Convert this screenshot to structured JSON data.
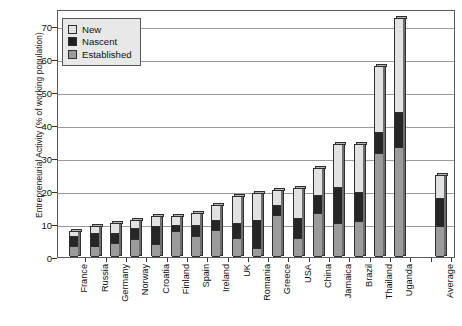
{
  "chart_data": {
    "type": "bar",
    "subtype": "stacked-bar",
    "title": "",
    "xlabel": "",
    "ylabel": "Entrepreneurial Activity (% of working population)",
    "ylim": [
      0,
      75
    ],
    "yticks": [
      0,
      10,
      20,
      30,
      40,
      50,
      60,
      70
    ],
    "ytick_labels": [
      "0",
      "10",
      "20",
      "30",
      "40",
      "50",
      "60",
      "70"
    ],
    "grid": true,
    "grid_axis": "y",
    "legend_position": "upper-left-inside",
    "stack_order_bottom_to_top": [
      "Established",
      "Nascent",
      "New"
    ],
    "categories": [
      "France",
      "Russia",
      "Germany",
      "Norway",
      "Croatia",
      "Finland",
      "Spain",
      "Ireland",
      "UK",
      "Romania",
      "Greece",
      "USA",
      "China",
      "Jamaica",
      "Brazil",
      "Thailand",
      "Uganda",
      "",
      "Average"
    ],
    "series": [
      {
        "name": "Established",
        "color": "#9b9b9b",
        "values": [
          3.0,
          3.0,
          4.0,
          5.0,
          3.5,
          7.5,
          6.0,
          8.0,
          5.5,
          2.5,
          12.5,
          5.5,
          13.0,
          10.0,
          10.5,
          31.0,
          33.0,
          null,
          9.0
        ]
      },
      {
        "name": "Nascent",
        "color": "#262626",
        "values": [
          3.0,
          4.0,
          3.0,
          3.5,
          5.5,
          2.0,
          3.5,
          3.0,
          4.5,
          8.5,
          3.0,
          6.0,
          5.5,
          11.0,
          9.0,
          6.5,
          10.5,
          null,
          8.5
        ]
      },
      {
        "name": "New",
        "color": "#e2e2e2",
        "values": [
          1.5,
          2.0,
          3.0,
          2.5,
          3.0,
          2.5,
          3.5,
          4.5,
          8.0,
          8.0,
          4.5,
          9.0,
          8.0,
          13.0,
          14.5,
          20.0,
          28.5,
          null,
          7.0
        ]
      }
    ],
    "totals": [
      7.5,
      9.0,
      10.0,
      11.0,
      12.0,
      12.0,
      13.0,
      15.5,
      18.0,
      19.0,
      20.0,
      20.5,
      26.5,
      34.0,
      34.0,
      57.5,
      72.0,
      null,
      24.5
    ]
  },
  "legend": {
    "items": [
      {
        "label": "New",
        "swatch": "new"
      },
      {
        "label": "Nascent",
        "swatch": "nascent"
      },
      {
        "label": "Established",
        "swatch": "established"
      }
    ]
  },
  "colors": {
    "new": "#e2e2e2",
    "nascent": "#262626",
    "established": "#9b9b9b",
    "axis": "#333333",
    "grid": "#9a9a9a",
    "background": "#ffffff"
  }
}
